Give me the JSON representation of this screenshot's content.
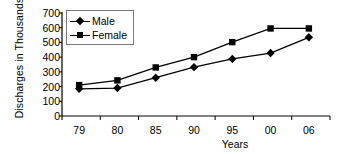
{
  "chart_data": {
    "type": "line",
    "title": "",
    "xlabel": "Years",
    "ylabel": "Discharges in Thousands",
    "categories": [
      "79",
      "80",
      "85",
      "90",
      "95",
      "00",
      "06"
    ],
    "series": [
      {
        "name": "Male",
        "marker": "diamond",
        "values": [
          185,
          190,
          260,
          332,
          388,
          428,
          535
        ]
      },
      {
        "name": "Female",
        "marker": "square",
        "values": [
          210,
          242,
          330,
          400,
          502,
          595,
          595
        ]
      }
    ],
    "ylim": [
      0,
      700
    ],
    "yticks": [
      700,
      600,
      500,
      400,
      300,
      200,
      100,
      0
    ],
    "grid": false,
    "legend_position": "top-left",
    "line_color": "#000000",
    "axis_color": "#000000"
  },
  "legend": {
    "items": [
      {
        "label": "Male"
      },
      {
        "label": "Female"
      }
    ]
  }
}
